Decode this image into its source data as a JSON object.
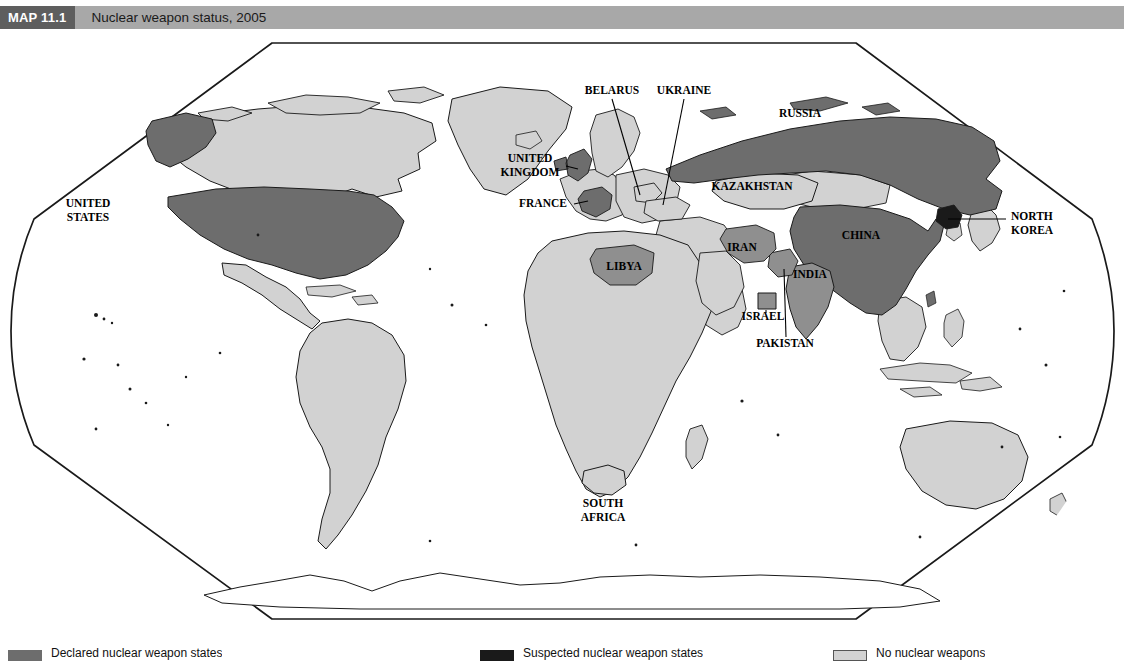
{
  "header": {
    "map_number": "MAP 11.1",
    "title": "Nuclear weapon status, 2005",
    "box_color": "#5e5e5e",
    "bar_color": "#a8a8a8"
  },
  "colors": {
    "declared_nuclear": "#6d6d6d",
    "undeclared_nuclear": "#8f8f8f",
    "suspected_nuclear": "#1a1a1a",
    "no_nuclear": "#d2d2d2",
    "ocean": "#ffffff",
    "border": "#1a1a1a",
    "label": "#000000"
  },
  "legend": {
    "entries": [
      {
        "id": "declared",
        "swatch_color": "#6d6d6d",
        "label": "Declared nuclear weapon states",
        "x": 8
      },
      {
        "id": "suspected",
        "swatch_color": "#1a1a1a",
        "label": "Suspected nuclear weapon states",
        "x": 480
      },
      {
        "id": "none",
        "swatch_color": "#d2d2d2",
        "label": "No nuclear weapons",
        "x": 833
      }
    ]
  },
  "map": {
    "projection": "robinson",
    "frame_color": "#1a1a1a",
    "labels": [
      {
        "id": "united-states",
        "text": "UNITED\nSTATES",
        "x": 88,
        "y": 178,
        "anchor": "middle",
        "size": 11.5
      },
      {
        "id": "united-kingdom",
        "text": "UNITED\nKINGDOM",
        "x": 530,
        "y": 133,
        "anchor": "middle",
        "size": 11.5
      },
      {
        "id": "france",
        "text": "FRANCE",
        "x": 543,
        "y": 178,
        "anchor": "middle",
        "size": 11.5
      },
      {
        "id": "belarus",
        "text": "BELARUS",
        "x": 612,
        "y": 65,
        "anchor": "middle",
        "size": 11.5
      },
      {
        "id": "ukraine",
        "text": "UKRAINE",
        "x": 684,
        "y": 65,
        "anchor": "middle",
        "size": 11.5
      },
      {
        "id": "russia",
        "text": "RUSSIA",
        "x": 800,
        "y": 88,
        "anchor": "middle",
        "size": 11.5
      },
      {
        "id": "kazakhstan",
        "text": "KAZAKHSTAN",
        "x": 752,
        "y": 161,
        "anchor": "middle",
        "size": 11.5
      },
      {
        "id": "china",
        "text": "CHINA",
        "x": 861,
        "y": 210,
        "anchor": "middle",
        "size": 11.5
      },
      {
        "id": "north-korea",
        "text": "NORTH\nKOREA",
        "x": 1011,
        "y": 191,
        "anchor": "start",
        "size": 11.5
      },
      {
        "id": "iran",
        "text": "IRAN",
        "x": 742,
        "y": 222,
        "anchor": "middle",
        "size": 11.5
      },
      {
        "id": "india",
        "text": "INDIA",
        "x": 810,
        "y": 249,
        "anchor": "middle",
        "size": 11.5
      },
      {
        "id": "pakistan",
        "text": "PAKISTAN",
        "x": 785,
        "y": 318,
        "anchor": "middle",
        "size": 11.5
      },
      {
        "id": "israel",
        "text": "ISRAEL",
        "x": 763,
        "y": 291,
        "anchor": "middle",
        "size": 11.5
      },
      {
        "id": "libya",
        "text": "LIBYA",
        "x": 624,
        "y": 241,
        "anchor": "middle",
        "size": 11.5
      },
      {
        "id": "south-africa",
        "text": "SOUTH\nAFRICA",
        "x": 603,
        "y": 478,
        "anchor": "middle",
        "size": 11.5
      }
    ],
    "leader_lines": [
      {
        "id": "belarus-leader",
        "x1": 612,
        "y1": 70,
        "x2": 640,
        "y2": 166
      },
      {
        "id": "ukraine-leader",
        "x1": 684,
        "y1": 70,
        "x2": 663,
        "y2": 174
      },
      {
        "id": "france-leader",
        "x1": 573,
        "y1": 175,
        "x2": 589,
        "y2": 172
      },
      {
        "id": "uk-leader",
        "x1": 567,
        "y1": 138,
        "x2": 580,
        "y2": 144
      },
      {
        "id": "north-korea-leader",
        "x1": 1008,
        "y1": 190,
        "x2": 946,
        "y2": 190
      },
      {
        "id": "pakistan-leader",
        "x1": 786,
        "y1": 310,
        "x2": 785,
        "y2": 237
      },
      {
        "id": "israel-leader",
        "x1": 766,
        "y1": 284,
        "x2": 766,
        "y2": 279
      }
    ],
    "country_status": {
      "declared_nuclear": [
        "United States",
        "Russia",
        "United Kingdom",
        "France",
        "China"
      ],
      "undeclared_nuclear": [
        "India",
        "Pakistan",
        "Israel",
        "Iran",
        "Libya"
      ],
      "suspected_nuclear": [
        "North Korea"
      ],
      "former_or_renounced": [
        "Belarus",
        "Ukraine",
        "Kazakhstan",
        "South Africa"
      ]
    }
  }
}
